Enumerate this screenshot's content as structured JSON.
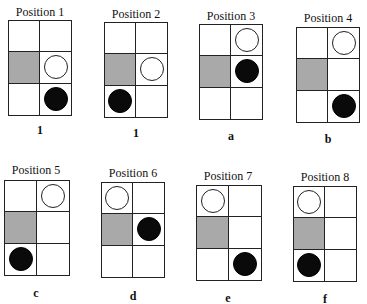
{
  "figure": {
    "colors": {
      "shaded_cell": "#a9a9a9",
      "grid_line": "#222222",
      "black_piece": "#0a0a0a",
      "white_piece": "#ffffff"
    },
    "grid_layout": {
      "columns": 2,
      "rows": 3,
      "shaded_cell": "row2-col1"
    },
    "positions": [
      {
        "title": "Position 1",
        "label": "1",
        "white_piece": "row2-col2",
        "black_piece": "row3-col2"
      },
      {
        "title": "Position 2",
        "label": "1",
        "white_piece": "row2-col2",
        "black_piece": "row3-col1"
      },
      {
        "title": "Position 3",
        "label": "a",
        "white_piece": "row1-col2",
        "black_piece": "row2-col2"
      },
      {
        "title": "Position 4",
        "label": "b",
        "white_piece": "row1-col2",
        "black_piece": "row3-col2"
      },
      {
        "title": "Position 5",
        "label": "c",
        "white_piece": "row1-col2",
        "black_piece": "row3-col1"
      },
      {
        "title": "Position 6",
        "label": "d",
        "white_piece": "row1-col1",
        "black_piece": "row2-col2"
      },
      {
        "title": "Position 7",
        "label": "e",
        "white_piece": "row1-col1",
        "black_piece": "row3-col2"
      },
      {
        "title": "Position 8",
        "label": "f",
        "white_piece": "row1-col1",
        "black_piece": "row3-col1"
      }
    ]
  }
}
